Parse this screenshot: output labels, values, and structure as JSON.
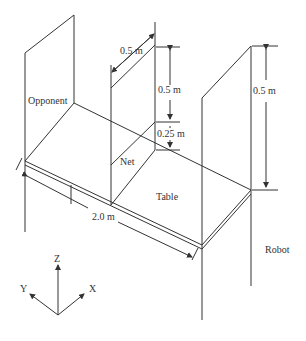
{
  "labels": {
    "opponent": "Opponent",
    "net": "Net",
    "table": "Table",
    "robot": "Robot",
    "net_width": "0.5 m",
    "net_height": "0.5 m",
    "net_gap": "0.25 m",
    "robot_height": "0.5 m",
    "table_length": "2.0 m"
  },
  "axes": {
    "z": "Z",
    "y": "Y",
    "x": "X"
  },
  "colors": {
    "line": "#333333",
    "background": "#ffffff"
  }
}
